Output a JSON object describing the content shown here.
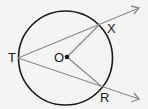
{
  "diagram": {
    "type": "geometry",
    "circle": {
      "center": [
        65.5,
        58
      ],
      "radius": 47,
      "stroke": "#1a1a1a"
    },
    "points": {
      "T": {
        "label": "T",
        "pos": [
          18,
          58
        ]
      },
      "O": {
        "label": "O",
        "pos": [
          67,
          57
        ]
      },
      "X": {
        "label": "X",
        "pos": [
          100,
          24
        ]
      },
      "R": {
        "label": "R",
        "pos": [
          101,
          86
        ]
      }
    },
    "rays": [
      {
        "from": "T",
        "through": "X",
        "tip": [
          139,
          8
        ]
      },
      {
        "from": "T",
        "through": "R",
        "tip": [
          139,
          99
        ]
      }
    ],
    "segments": [
      {
        "from": "O",
        "to": "X"
      },
      {
        "from": "O",
        "to": "R"
      }
    ],
    "line_color": "#8a8a8a"
  }
}
